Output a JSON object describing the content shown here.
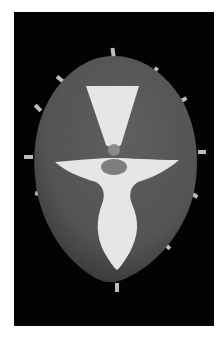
{
  "image": {
    "description": "Grayscale photograph of a textured oval shield-like artwork on black background with a white stylized figure",
    "colors": {
      "page_background": "#ffffff",
      "frame": "#030303",
      "shield": "#5a5a5a",
      "shield_shadow": "#3a3a3a",
      "figure": "#e6e6e6",
      "head": "#7e7e7e",
      "neck": "#8a8a8a",
      "tabs": "#bdbdbd"
    }
  }
}
